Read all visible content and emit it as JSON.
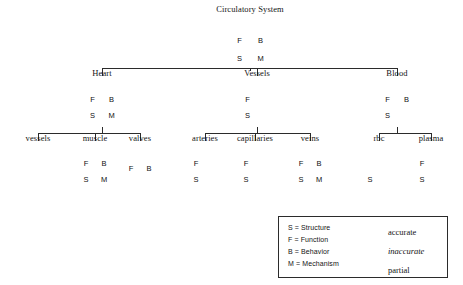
{
  "colors": {
    "stroke": "#2b2b2b",
    "accurate_fill": "#ffffff",
    "inaccurate_fill": "#000000",
    "partial_fill": "hatched",
    "text": "#141414"
  },
  "quadrant_keys": {
    "top_left": "F",
    "top_right": "B",
    "bottom_left": "S",
    "bottom_right": "M"
  },
  "nodes": [
    {
      "id": "circulatory-system",
      "label": "Circulatory System",
      "level": 0,
      "cx": 250,
      "cy": 50,
      "r": 21,
      "shape": "full-circle",
      "label_x": 250,
      "label_y": 13,
      "quadrants": [
        {
          "pos": "top_left",
          "letter": "F",
          "state": "accurate"
        },
        {
          "pos": "top_right",
          "letter": "B",
          "state": "accurate"
        },
        {
          "pos": "bottom_left",
          "letter": "S",
          "state": "accurate"
        },
        {
          "pos": "bottom_right",
          "letter": "M",
          "state": "accurate"
        }
      ]
    },
    {
      "id": "heart",
      "label": "Heart",
      "level": 1,
      "cx": 102,
      "cy": 108,
      "r": 19,
      "shape": "full-circle",
      "label_x": 102,
      "label_y": 77,
      "quadrants": [
        {
          "pos": "top_left",
          "letter": "F",
          "state": "accurate"
        },
        {
          "pos": "top_right",
          "letter": "B",
          "state": "accurate"
        },
        {
          "pos": "bottom_left",
          "letter": "S",
          "state": "partial"
        },
        {
          "pos": "bottom_right",
          "letter": "M",
          "state": "partial"
        }
      ]
    },
    {
      "id": "vessels",
      "label": "Vessels",
      "level": 1,
      "cx": 257,
      "cy": 108,
      "r": 19,
      "shape": "full-circle",
      "label_x": 257,
      "label_y": 77,
      "quadrants": [
        {
          "pos": "top_left",
          "letter": "F",
          "state": "accurate"
        },
        {
          "pos": "top_right",
          "letter": "B",
          "state": "inaccurate"
        },
        {
          "pos": "bottom_left",
          "letter": "S",
          "state": "accurate"
        },
        {
          "pos": "bottom_right",
          "letter": "",
          "state": "inaccurate"
        }
      ]
    },
    {
      "id": "blood",
      "label": "Blood",
      "level": 1,
      "cx": 397,
      "cy": 108,
      "r": 19,
      "shape": "full-circle",
      "label_x": 397,
      "label_y": 77,
      "quadrants": [
        {
          "pos": "top_left",
          "letter": "F",
          "state": "accurate"
        },
        {
          "pos": "top_right",
          "letter": "B",
          "state": "accurate"
        },
        {
          "pos": "bottom_left",
          "letter": "S",
          "state": "partial"
        },
        {
          "pos": "bottom_right",
          "letter": "",
          "state": "inaccurate"
        }
      ]
    },
    {
      "id": "vessels-child",
      "label": "vessels",
      "level": 2,
      "cx": 38,
      "cy": 0,
      "r": 0,
      "shape": "none",
      "label_x": 38,
      "label_y": 142,
      "quadrants": []
    },
    {
      "id": "muscle",
      "label": "muscle",
      "level": 2,
      "cx": 95,
      "cy": 172,
      "r": 18,
      "shape": "full-circle",
      "label_x": 95,
      "label_y": 142,
      "quadrants": [
        {
          "pos": "top_left",
          "letter": "F",
          "state": "accurate"
        },
        {
          "pos": "top_right",
          "letter": "B",
          "state": "accurate"
        },
        {
          "pos": "bottom_left",
          "letter": "S",
          "state": "partial"
        },
        {
          "pos": "bottom_right",
          "letter": "M",
          "state": "partial"
        }
      ]
    },
    {
      "id": "valves",
      "label": "valves",
      "level": 2,
      "cx": 140,
      "cy": 177,
      "r": 18,
      "shape": "top-half",
      "label_x": 140,
      "label_y": 142,
      "quadrants": [
        {
          "pos": "top_left",
          "letter": "F",
          "state": "accurate"
        },
        {
          "pos": "top_right",
          "letter": "B",
          "state": "accurate"
        }
      ]
    },
    {
      "id": "arteries",
      "label": "arteries",
      "level": 2,
      "cx": 205,
      "cy": 172,
      "r": 18,
      "shape": "full-circle",
      "label_x": 205,
      "label_y": 142,
      "quadrants": [
        {
          "pos": "top_left",
          "letter": "F",
          "state": "accurate"
        },
        {
          "pos": "top_right",
          "letter": "",
          "state": "inaccurate"
        },
        {
          "pos": "bottom_left",
          "letter": "S",
          "state": "accurate"
        },
        {
          "pos": "bottom_right",
          "letter": "",
          "state": "inaccurate"
        }
      ]
    },
    {
      "id": "capillaries",
      "label": "capillaries",
      "level": 2,
      "cx": 255,
      "cy": 172,
      "r": 18,
      "shape": "full-circle",
      "label_x": 255,
      "label_y": 142,
      "quadrants": [
        {
          "pos": "top_left",
          "letter": "F",
          "state": "accurate"
        },
        {
          "pos": "top_right",
          "letter": "",
          "state": "inaccurate"
        },
        {
          "pos": "bottom_left",
          "letter": "S",
          "state": "accurate"
        },
        {
          "pos": "bottom_right",
          "letter": "",
          "state": "inaccurate"
        }
      ]
    },
    {
      "id": "veins",
      "label": "veins",
      "level": 2,
      "cx": 310,
      "cy": 172,
      "r": 18,
      "shape": "full-circle",
      "label_x": 310,
      "label_y": 142,
      "quadrants": [
        {
          "pos": "top_left",
          "letter": "F",
          "state": "accurate"
        },
        {
          "pos": "top_right",
          "letter": "B",
          "state": "accurate"
        },
        {
          "pos": "bottom_left",
          "letter": "S",
          "state": "accurate"
        },
        {
          "pos": "bottom_right",
          "letter": "M",
          "state": "accurate"
        }
      ]
    },
    {
      "id": "rbc",
      "label": "rbc",
      "level": 2,
      "cx": 379,
      "cy": 172,
      "r": 18,
      "shape": "three-quarter-no-br",
      "label_x": 379,
      "label_y": 142,
      "quadrants": [
        {
          "pos": "top_left",
          "letter": "",
          "state": "inaccurate"
        },
        {
          "pos": "top_right",
          "letter": "",
          "state": "inaccurate"
        },
        {
          "pos": "bottom_left",
          "letter": "S",
          "state": "accurate"
        }
      ]
    },
    {
      "id": "plasma",
      "label": "plasma",
      "level": 2,
      "cx": 431,
      "cy": 172,
      "r": 18,
      "shape": "left-half",
      "label_x": 431,
      "label_y": 142,
      "quadrants": [
        {
          "pos": "top_left",
          "letter": "F",
          "state": "accurate"
        },
        {
          "pos": "bottom_left",
          "letter": "S",
          "state": "accurate"
        }
      ]
    }
  ],
  "edges": [
    {
      "from": "circulatory-system",
      "to": [
        "heart",
        "vessels",
        "blood"
      ]
    },
    {
      "from": "heart",
      "to": [
        "vessels-child",
        "muscle",
        "valves"
      ]
    },
    {
      "from": "vessels",
      "to": [
        "arteries",
        "capillaries",
        "veins"
      ]
    },
    {
      "from": "blood",
      "to": [
        "rbc",
        "plasma"
      ]
    }
  ],
  "legend": {
    "box": {
      "x": 278,
      "y": 216,
      "width": 170,
      "height": 62
    },
    "keys": [
      {
        "text": "S = Structure",
        "x": 288,
        "y": 224
      },
      {
        "text": "F = Function",
        "x": 288,
        "y": 236
      },
      {
        "text": "B = Behavior",
        "x": 288,
        "y": 248
      },
      {
        "text": "M = Mechanism",
        "x": 288,
        "y": 260
      }
    ],
    "swatches": [
      {
        "state": "accurate",
        "label": "accurate",
        "italic": false,
        "x": 363,
        "y": 222
      },
      {
        "state": "inaccurate",
        "label": "inaccurate",
        "italic": true,
        "x": 363,
        "y": 241
      },
      {
        "state": "partial",
        "label": "partial",
        "italic": false,
        "x": 363,
        "y": 260
      }
    ]
  }
}
